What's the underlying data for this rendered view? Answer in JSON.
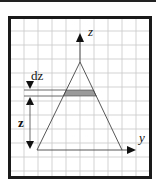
{
  "figure": {
    "width": 156,
    "height": 186,
    "colors": {
      "frame": "#1a1a1a",
      "grid": "#c8c8c8",
      "lines": "#444444",
      "strip_fill": "#9a9a9a",
      "text": "#111111"
    },
    "frame": {
      "x": 9.5,
      "y": 17.5,
      "w": 141,
      "h": 160
    },
    "grid": {
      "x0": 10,
      "y0": 18,
      "x1": 150,
      "y1": 177,
      "spacing": 14,
      "offset_x": 14,
      "offset_y": 13
    },
    "labels": {
      "z_axis": "z",
      "y_axis": "y",
      "dz": "dz",
      "z_height": "z"
    },
    "triangle": {
      "apex": [
        80,
        62
      ],
      "base_left": [
        37,
        150
      ],
      "base_right": [
        122,
        150
      ]
    },
    "strip": {
      "y_top": 90,
      "y_bottom": 96
    },
    "z_axis": {
      "x": 80,
      "y_from": 62,
      "y_to": 33
    },
    "y_axis": {
      "y": 150,
      "x_from": 122,
      "x_to": 136
    },
    "ref_lines": {
      "x_from": 24
    },
    "dimension": {
      "x": 30
    }
  }
}
